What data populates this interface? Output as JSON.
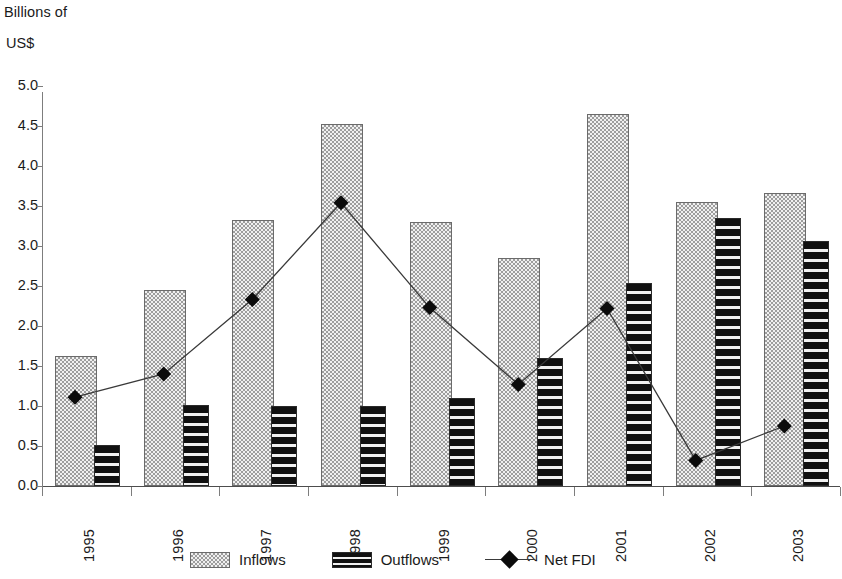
{
  "chart_data": {
    "type": "bar",
    "title": "",
    "subtitle": "",
    "xlabel": "",
    "ylabel": "Billions of US$",
    "ylabel_lines": [
      "Billions of",
      "US$"
    ],
    "categories": [
      "1995",
      "1996",
      "1997",
      "1998",
      "1999",
      "2000",
      "2001",
      "2002",
      "2003"
    ],
    "ylim": [
      0.0,
      5.0
    ],
    "ytick_labels": [
      "0.0",
      "0.5",
      "1.0",
      "1.5",
      "2.0",
      "2.5",
      "3.0",
      "3.5",
      "4.0",
      "4.5",
      "5.0"
    ],
    "ytick_values": [
      0.0,
      0.5,
      1.0,
      1.5,
      2.0,
      2.5,
      3.0,
      3.5,
      4.0,
      4.5,
      5.0
    ],
    "grid": false,
    "legend_position": "bottom",
    "series": [
      {
        "name": "Inflows",
        "kind": "bar",
        "pattern": "stipple-gray",
        "color": "#9d9d9d",
        "values": [
          1.6,
          2.42,
          3.3,
          4.5,
          3.27,
          2.82,
          4.63,
          3.53,
          3.64
        ]
      },
      {
        "name": "Outflows",
        "kind": "bar",
        "pattern": "horizontal-stripes-black",
        "color": "#111111",
        "values": [
          0.49,
          0.99,
          0.97,
          0.97,
          1.07,
          1.58,
          2.51,
          3.33,
          3.04
        ]
      },
      {
        "name": "Net FDI",
        "kind": "line",
        "marker": "diamond",
        "color": "#0b0b0b",
        "values": [
          1.11,
          1.4,
          2.33,
          3.54,
          2.23,
          1.27,
          2.22,
          0.32,
          0.75
        ]
      }
    ]
  },
  "legend": {
    "items": [
      {
        "label": "Inflows",
        "swatch": "inflow-swatch-icon"
      },
      {
        "label": "Outflows",
        "swatch": "outflow-swatch-icon"
      },
      {
        "label": "Net FDI",
        "swatch": "netfdi-line-diamond-icon"
      }
    ]
  }
}
